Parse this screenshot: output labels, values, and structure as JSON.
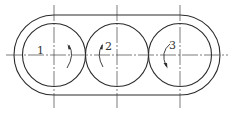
{
  "diagram": {
    "title": "",
    "stroke_color": "#2b2b2b",
    "centerline_color": "#444444",
    "housing": {
      "left_center": [
        54,
        55
      ],
      "right_center": [
        180,
        55
      ],
      "outer_radius": 40
    },
    "rollers": [
      {
        "id": 1,
        "label": "1",
        "center": [
          54,
          55
        ],
        "radius": 31.5,
        "rotation": "clockwise"
      },
      {
        "id": 2,
        "label": "2",
        "center": [
          117,
          55
        ],
        "radius": 31.5,
        "rotation": "counterclockwise"
      },
      {
        "id": 3,
        "label": "3",
        "center": [
          180,
          55
        ],
        "radius": 31.5,
        "rotation": "counterclockwise"
      }
    ],
    "centerlines": {
      "horizontal": {
        "y": 55,
        "x_start": 6,
        "x_end": 228
      },
      "vertical_y_start": 5,
      "vertical_y_end": 108
    }
  }
}
